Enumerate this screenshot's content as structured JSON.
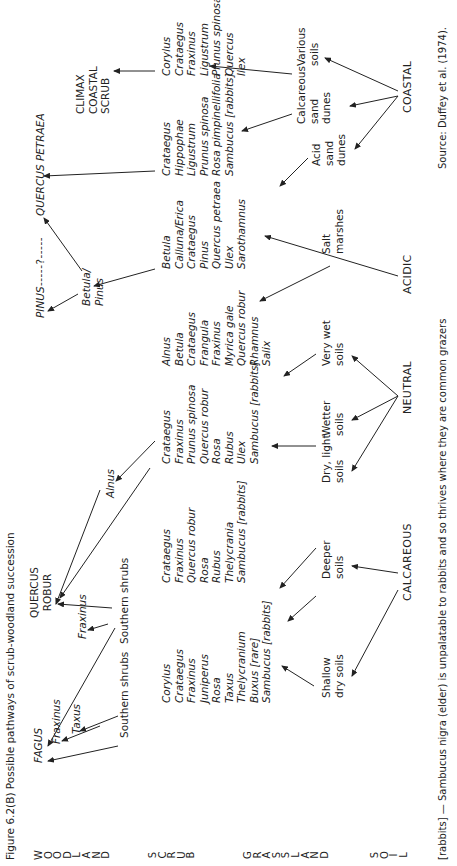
{
  "caption": "Figure 6.2(B)  Possible pathways of scrub-woodland succession",
  "row_labels": {
    "woodland": [
      "W",
      "O",
      "O",
      "D",
      "L",
      "A",
      "N",
      "D"
    ],
    "scrub": [
      "S",
      "C",
      "R",
      "U",
      "B"
    ],
    "grassland": [
      "G",
      "R",
      "A",
      "S",
      "S",
      "L",
      "A",
      "N",
      "D"
    ],
    "soil": [
      "S",
      "O",
      "I",
      "L"
    ]
  },
  "woodland": {
    "fagus": "FAGUS",
    "fraxinus": "Fraxinus",
    "taxus": "Taxus",
    "quercus_robur": [
      "QUERCUS",
      "ROBUR"
    ],
    "fraxinus2": "Fraxinus",
    "alnus": "Alnus",
    "pinus": "PINUS",
    "dashes": "-----?-----",
    "quercus_petraea": "QUERCUS PETRAEA",
    "betula_pinus": [
      "Betula/",
      "Pinus"
    ],
    "climax": [
      "CLIMAX",
      "COASTAL",
      "SCRUB"
    ],
    "southern_shrubs_1": "Southern shrubs",
    "southern_shrubs_2": "Southern shrubs"
  },
  "scrub": {
    "col1": [
      "Corylus",
      "Crataegus",
      "Fraxinus",
      "Juniperus",
      "Rosa",
      "Taxus",
      "Thelycranium",
      "Buxus [rare]",
      "Sambucus [rabbits]"
    ],
    "col2": [
      "Crataegus",
      "Fraxinus",
      "Quercus robur",
      "Rosa",
      "Rubus",
      "Thelycrania",
      "Sambucus [rabbits]"
    ],
    "col3": [
      "Crataegus",
      "Fraxinus",
      "Prunus spinosa",
      "Quercus robur",
      "Rosa",
      "Rubus",
      "Ulex",
      "Sambucus [rabbits]"
    ],
    "col4": [
      "Alnus",
      "Betula",
      "Crataegus",
      "Frangula",
      "Fraxinus",
      "Myrica gale",
      "Quercus robur",
      "Rhamnus",
      "Salix"
    ],
    "col5": [
      "Betula",
      "Calluna/Erica",
      "Crataegus",
      "Pinus",
      "Quercus petraea",
      "Ulex",
      "Sarothamnus"
    ],
    "col6": [
      "Crataegus",
      "Hippophae",
      "Ligustrum",
      "Prunus spinosa",
      "Rosa pimpinellifolia",
      "Sambucus [rabbits]"
    ],
    "col7": [
      "Corylus",
      "Crataegus",
      "Fraxinus",
      "Ligustrum",
      "Prunus spinosa",
      "Quercus",
      "Ilex"
    ]
  },
  "grassland": {
    "shallow": [
      "Shallow",
      "dry soils"
    ],
    "deeper": [
      "Deeper",
      "soils"
    ],
    "dry_light": [
      "Dry, light",
      "soils"
    ],
    "wetter": [
      "Wetter",
      "soils"
    ],
    "very_wet": [
      "Very wet",
      "soils"
    ],
    "salt": [
      "Salt",
      "marshes"
    ],
    "acid_dunes": [
      "Acid",
      "sand",
      "dunes"
    ],
    "calc_dunes": [
      "Calcareous",
      "sand",
      "dunes"
    ],
    "various": [
      "Various",
      "soils"
    ]
  },
  "soil": {
    "calcareous": "CALCAREOUS",
    "neutral": "NEUTRAL",
    "acidic": "ACIDIC",
    "coastal": "COASTAL"
  },
  "footnote": "[rabbits]  —  Sambucus nigra (elder) is unpalatable to rabbits and so thrives where they are common grazers",
  "source": "Source: Duffey et al. (1974)."
}
